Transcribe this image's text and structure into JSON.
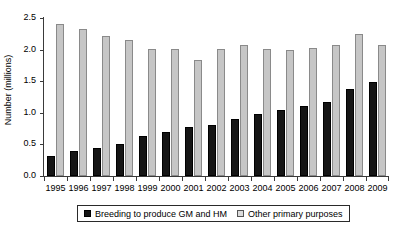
{
  "chart_data": {
    "type": "bar",
    "title": "",
    "xlabel": "",
    "ylabel": "Number (millions)",
    "ylim": [
      0.0,
      2.5
    ],
    "yticks": [
      "0.0",
      "0.5",
      "1.0",
      "1.5",
      "2.0",
      "2.5"
    ],
    "ytick_values": [
      0.0,
      0.5,
      1.0,
      1.5,
      2.0,
      2.5
    ],
    "grid": false,
    "legend_position": "bottom-center",
    "categories": [
      "1995",
      "1996",
      "1997",
      "1998",
      "1999",
      "2000",
      "2001",
      "2002",
      "2003",
      "2004",
      "2005",
      "2006",
      "2007",
      "2008",
      "2009"
    ],
    "series": [
      {
        "name": "Breeding to produce GM and HM",
        "color": "#151515",
        "values": [
          0.32,
          0.4,
          0.44,
          0.5,
          0.64,
          0.7,
          0.78,
          0.8,
          0.9,
          0.98,
          1.04,
          1.1,
          1.17,
          1.38,
          1.49
        ]
      },
      {
        "name": "Other primary purposes",
        "color": "#c6c6c6",
        "values": [
          2.4,
          2.33,
          2.21,
          2.15,
          2.01,
          2.01,
          1.83,
          2.01,
          2.08,
          2.01,
          2.0,
          2.02,
          2.07,
          2.25,
          2.07
        ]
      }
    ]
  },
  "legend": {
    "items": [
      {
        "label": "Breeding to produce GM and HM",
        "swatch": "black"
      },
      {
        "label": "Other primary purposes",
        "swatch": "gray"
      }
    ]
  }
}
